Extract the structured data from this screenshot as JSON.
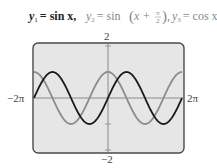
{
  "header": {
    "eq1": {
      "lhs": "y",
      "sub": "1",
      "rhs": "= sin x,",
      "color": "#222222"
    },
    "eq2": {
      "lhs": "y",
      "sub": "2",
      "rhs_pre": "= sin",
      "arg": "x +",
      "frac_num": "π",
      "frac_den": "2",
      "tail": ",",
      "color": "#888888"
    },
    "eq3": {
      "lhs": "y",
      "sub": "3",
      "rhs": "= cos x",
      "color": "#888888"
    }
  },
  "axes": {
    "ymax_label": "2",
    "ymin_label": "−2",
    "xmin_label": "−2π",
    "xmax_label": "2π"
  },
  "colors": {
    "screen_bg": "#e6e6e6",
    "screen_border": "#4a4a4a",
    "axis": "#8a8a8a",
    "sin_curve": "#1a1a1a",
    "cos_curve": "#8c8c8c"
  },
  "chart_data": {
    "type": "line",
    "xlabel": "",
    "ylabel": "",
    "xlim": [
      -6.2832,
      6.2832
    ],
    "ylim": [
      -2,
      2
    ],
    "x_tick_labels": [
      "−2π",
      "2π"
    ],
    "y_tick_labels": [
      "−2",
      "2"
    ],
    "y_ticks": [
      -1,
      1
    ],
    "grid": false,
    "legend": "none",
    "x": [
      -6.2832,
      -4.7124,
      -3.1416,
      -1.5708,
      0,
      1.5708,
      3.1416,
      4.7124,
      6.2832
    ],
    "series": [
      {
        "name": "y1 = sin x",
        "color": "#1a1a1a",
        "values": [
          0,
          1,
          0,
          -1,
          0,
          1,
          0,
          -1,
          0
        ]
      },
      {
        "name": "y2 = sin(x + π/2) = y3 = cos x",
        "color": "#8c8c8c",
        "values": [
          1,
          0,
          -1,
          0,
          1,
          0,
          -1,
          0,
          1
        ]
      }
    ],
    "annotation": "Graphs of y2 and y3 coincide"
  }
}
